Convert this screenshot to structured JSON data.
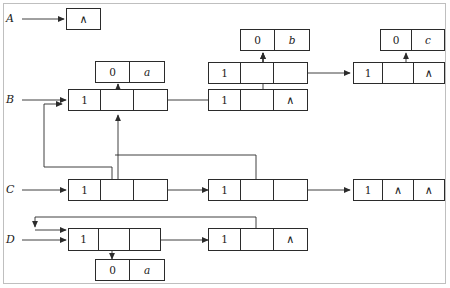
{
  "figure": {
    "type": "linked-list-sharing-diagram",
    "border_color": "#bfbfbf",
    "ink_color": "#2b2b2b",
    "nil_glyph": "∧",
    "labels": [
      {
        "name": "A",
        "text": "A"
      },
      {
        "name": "B",
        "text": "B"
      },
      {
        "name": "C",
        "text": "C"
      },
      {
        "name": "D",
        "text": "D"
      }
    ],
    "nodes": [
      {
        "id": "a-nil",
        "list": "A",
        "cells": [
          "∧"
        ]
      },
      {
        "id": "b-atom-a",
        "list": "B",
        "cells": [
          "0",
          "a"
        ]
      },
      {
        "id": "b1",
        "list": "B",
        "cells": [
          "1",
          "",
          ""
        ]
      },
      {
        "id": "b2",
        "list": "B",
        "cells": [
          "1",
          "",
          "∧"
        ]
      },
      {
        "id": "atom-b",
        "list": "shared",
        "cells": [
          "0",
          "b"
        ]
      },
      {
        "id": "s1",
        "list": "shared",
        "cells": [
          "1",
          "",
          ""
        ]
      },
      {
        "id": "atom-c",
        "list": "shared",
        "cells": [
          "0",
          "c"
        ]
      },
      {
        "id": "s2",
        "list": "shared",
        "cells": [
          "1",
          "",
          "∧"
        ]
      },
      {
        "id": "c1",
        "list": "C",
        "cells": [
          "1",
          "",
          ""
        ]
      },
      {
        "id": "c2",
        "list": "C",
        "cells": [
          "1",
          "",
          ""
        ]
      },
      {
        "id": "c3",
        "list": "C",
        "cells": [
          "1",
          "∧",
          "∧"
        ]
      },
      {
        "id": "d1",
        "list": "D",
        "cells": [
          "1",
          "",
          ""
        ]
      },
      {
        "id": "d2",
        "list": "D",
        "cells": [
          "1",
          "",
          "∧"
        ]
      },
      {
        "id": "d-atom-a",
        "list": "D",
        "cells": [
          "0",
          "a"
        ]
      }
    ],
    "cell_values": {
      "a_nil": "∧",
      "b_atom_tag": "0",
      "b_atom_val": "a",
      "b1_tag": "1",
      "b1_mid": "",
      "b1_next": "",
      "b2_tag": "1",
      "b2_mid": "",
      "b2_next": "∧",
      "atom_b_tag": "0",
      "atom_b_val": "b",
      "s1_tag": "1",
      "s1_mid": "",
      "s1_next": "",
      "atom_c_tag": "0",
      "atom_c_val": "c",
      "s2_tag": "1",
      "s2_mid": "",
      "s2_next": "∧",
      "c1_tag": "1",
      "c1_mid": "",
      "c1_next": "",
      "c2_tag": "1",
      "c2_mid": "",
      "c2_next": "",
      "c3_tag": "1",
      "c3_mid": "∧",
      "c3_next": "∧",
      "d1_tag": "1",
      "d1_mid": "",
      "d1_next": "",
      "d2_tag": "1",
      "d2_mid": "",
      "d2_next": "∧",
      "d_atom_tag": "0",
      "d_atom_val": "a"
    }
  }
}
